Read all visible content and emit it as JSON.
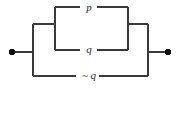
{
  "diagram": {
    "type": "switching-circuit",
    "colors": {
      "background": "#ffffff",
      "wire": "#3a3a3a",
      "terminal": "#111111",
      "label": "#2b2b2b"
    },
    "terminals": [
      {
        "id": "left-terminal",
        "x": 12,
        "y": 52
      },
      {
        "id": "right-terminal",
        "x": 168,
        "y": 52
      }
    ],
    "branches": [
      {
        "id": "branch-p",
        "label": "p",
        "position": "top",
        "y": 7,
        "x_start": 55,
        "x_end": 128
      },
      {
        "id": "branch-q",
        "label": "q",
        "position": "middle",
        "y": 50,
        "x_start": 55,
        "x_end": 128
      },
      {
        "id": "branch-nq",
        "label": "~ q",
        "position": "bottom",
        "y": 76,
        "x_start": 33,
        "x_end": 148
      }
    ],
    "labels": {
      "p": "p",
      "q": "q",
      "not_q": "~ q"
    },
    "wires": {
      "inner_left_x": 55,
      "inner_right_x": 128,
      "outer_left_x": 33,
      "outer_right_x": 148,
      "junction_y": 24,
      "terminal_y": 52
    }
  }
}
